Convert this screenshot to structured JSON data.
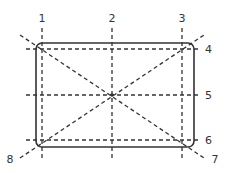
{
  "diagram": {
    "type": "rectangle-guide-lines",
    "frame": {
      "x": 36,
      "y": 43,
      "width": 158,
      "height": 104,
      "corner_radius": 6
    },
    "colors": {
      "line": "#333333",
      "background": "#ffffff"
    },
    "labels": {
      "l1": "1",
      "l2": "2",
      "l3": "3",
      "l4": "4",
      "l5": "5",
      "l6": "6",
      "l7": "7",
      "l8": "8"
    },
    "vertical_lines": [
      {
        "label": "1",
        "x": 42
      },
      {
        "label": "2",
        "x": 112
      },
      {
        "label": "3",
        "x": 182
      }
    ],
    "horizontal_lines": [
      {
        "label": "4",
        "y": 49
      },
      {
        "label": "5",
        "y": 95
      },
      {
        "label": "6",
        "y": 140
      }
    ],
    "diagonal_lines": [
      {
        "label": "7",
        "from": [
          20,
          35
        ],
        "to": [
          204,
          158
        ]
      },
      {
        "label": "8",
        "from": [
          20,
          158
        ],
        "to": [
          204,
          35
        ]
      }
    ],
    "center_point": [
      112,
      95
    ]
  }
}
